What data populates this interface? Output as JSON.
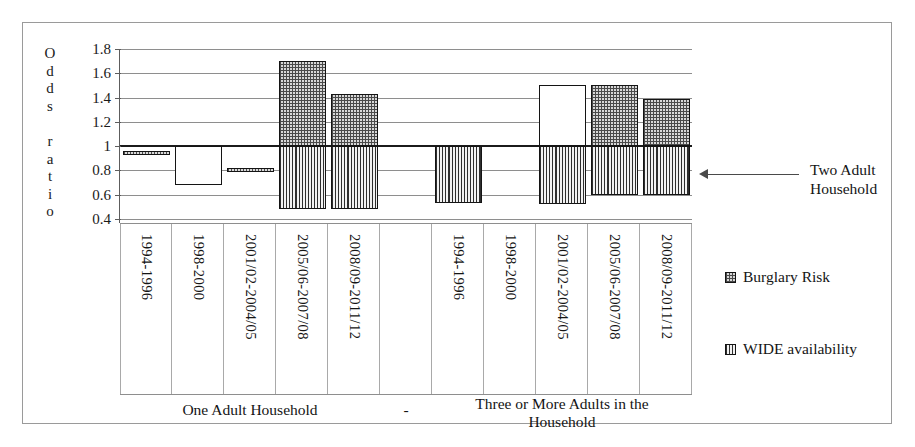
{
  "axis_title_letters": [
    "O",
    "d",
    "d",
    "s",
    "",
    "r",
    "a",
    "t",
    "i",
    "o"
  ],
  "axis_title_text": "Odds ratio",
  "annotation": {
    "label_line1": "Two Adult",
    "label_line2": "Household",
    "arrow": "left-arrow-icon"
  },
  "legend": {
    "items": [
      {
        "label": "Burglary Risk",
        "pattern": "dotted",
        "swatch": "dotted-swatch-icon"
      },
      {
        "label": "WIDE availability",
        "pattern": "vertical-lines",
        "swatch": "vertical-lines-swatch-icon"
      }
    ]
  },
  "group_captions": [
    {
      "text": "One Adult Household"
    },
    {
      "text": "-"
    },
    {
      "text": "Three or More Adults in the\nHousehold",
      "line1": "Three or More Adults in the",
      "line2": "Household"
    }
  ],
  "chart_data": {
    "type": "bar",
    "title": "",
    "xlabel": "",
    "ylabel": "Odds ratio",
    "ylim": [
      0.4,
      1.8
    ],
    "yticks": [
      "0.4",
      "0.6",
      "0.8",
      "1",
      "1.2",
      "1.4",
      "1.6",
      "1.8"
    ],
    "ytick_values": [
      0.4,
      0.6,
      0.8,
      1.0,
      1.2,
      1.4,
      1.6,
      1.8
    ],
    "grid": true,
    "reference_line": 1.0,
    "reference_line_label": "Two Adult Household",
    "legend_position": "right",
    "groups": [
      {
        "name": "One Adult Household",
        "categories": [
          "1994-1996",
          "1998-2000",
          "2001/02-2004/05",
          "2005/06-2007/08",
          "2008/09-2011/12"
        ]
      },
      {
        "name": "-",
        "categories": []
      },
      {
        "name": "Three or More Adults in the Household",
        "categories": [
          "1994-1996",
          "1998-2000",
          "2001/02-2004/05",
          "2005/06-2007/08",
          "2008/09-2011/12"
        ]
      }
    ],
    "categories": [
      "1994-1996",
      "1998-2000",
      "2001/02-2004/05",
      "2005/06-2007/08",
      "2008/09-2011/12",
      "",
      "1994-1996",
      "1998-2000",
      "2001/02-2004/05",
      "2005/06-2007/08",
      "2008/09-2011/12"
    ],
    "series": [
      {
        "name": "Burglary Risk",
        "pattern": "dotted",
        "values": [
          0.96,
          0.68,
          0.81,
          1.7,
          1.43,
          null,
          null,
          null,
          1.5,
          1.5,
          1.39
        ]
      },
      {
        "name": "WIDE availability",
        "pattern": "vertical-lines",
        "values": [
          null,
          null,
          null,
          0.48,
          0.48,
          null,
          0.53,
          null,
          0.52,
          0.6,
          0.6
        ]
      }
    ],
    "bars": [
      {
        "group": 0,
        "category": "1994-1996",
        "series": "Burglary Risk",
        "top": 0.96,
        "bottom": 0.94,
        "fill": "dotted"
      },
      {
        "group": 0,
        "category": "1998-2000",
        "series": "Burglary Risk",
        "top": 1.0,
        "bottom": 0.68,
        "fill": "white"
      },
      {
        "group": 0,
        "category": "2001/02-2004/05",
        "series": "Burglary Risk",
        "top": 0.82,
        "bottom": 0.8,
        "fill": "dotted"
      },
      {
        "group": 0,
        "category": "2005/06-2007/08",
        "series": "Burglary Risk",
        "top": 1.7,
        "bottom": 1.0,
        "fill": "dotted"
      },
      {
        "group": 0,
        "category": "2005/06-2007/08",
        "series": "WIDE availability",
        "top": 1.0,
        "bottom": 0.48,
        "fill": "vertical-lines"
      },
      {
        "group": 0,
        "category": "2008/09-2011/12",
        "series": "Burglary Risk",
        "top": 1.43,
        "bottom": 1.0,
        "fill": "dotted"
      },
      {
        "group": 0,
        "category": "2008/09-2011/12",
        "series": "WIDE availability",
        "top": 1.0,
        "bottom": 0.48,
        "fill": "vertical-lines"
      },
      {
        "group": 2,
        "category": "1994-1996",
        "series": "WIDE availability",
        "top": 1.0,
        "bottom": 0.53,
        "fill": "vertical-lines"
      },
      {
        "group": 2,
        "category": "2001/02-2004/05",
        "series": "Burglary Risk",
        "top": 1.5,
        "bottom": 1.0,
        "fill": "white"
      },
      {
        "group": 2,
        "category": "2001/02-2004/05",
        "series": "WIDE availability",
        "top": 1.0,
        "bottom": 0.52,
        "fill": "vertical-lines"
      },
      {
        "group": 2,
        "category": "2005/06-2007/08",
        "series": "Burglary Risk",
        "top": 1.5,
        "bottom": 1.0,
        "fill": "dotted"
      },
      {
        "group": 2,
        "category": "2005/06-2007/08",
        "series": "WIDE availability",
        "top": 1.0,
        "bottom": 0.6,
        "fill": "vertical-lines"
      },
      {
        "group": 2,
        "category": "2008/09-2011/12",
        "series": "Burglary Risk",
        "top": 1.39,
        "bottom": 1.0,
        "fill": "dotted"
      },
      {
        "group": 2,
        "category": "2008/09-2011/12",
        "series": "WIDE availability",
        "top": 1.0,
        "bottom": 0.6,
        "fill": "vertical-lines"
      }
    ]
  }
}
